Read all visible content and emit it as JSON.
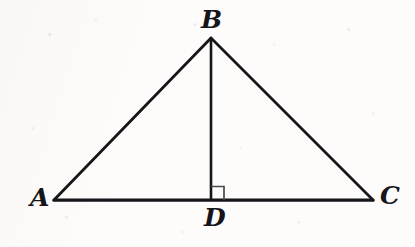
{
  "figure": {
    "kind": "geometry-diagram",
    "background_color": "#fdfcfa",
    "stroke_color": "#16161a",
    "right_angle_mark_color": "#4a4a4e",
    "labels": [
      {
        "id": "A",
        "text": "A",
        "x": 38,
        "y": 198,
        "role": "vertex-label"
      },
      {
        "id": "B",
        "text": "B",
        "x": 211,
        "y": 20,
        "role": "vertex-label"
      },
      {
        "id": "C",
        "text": "C",
        "x": 388,
        "y": 196,
        "role": "vertex-label"
      },
      {
        "id": "D",
        "text": "D",
        "x": 213,
        "y": 218,
        "role": "vertex-label"
      }
    ],
    "points": {
      "A": {
        "x": 54,
        "y": 200
      },
      "B": {
        "x": 211,
        "y": 38
      },
      "C": {
        "x": 373,
        "y": 200
      },
      "D": {
        "x": 211,
        "y": 200
      }
    },
    "segments": [
      {
        "id": "AB",
        "from": "A",
        "to": "B",
        "width": 2.8
      },
      {
        "id": "BC",
        "from": "B",
        "to": "C",
        "width": 2.8
      },
      {
        "id": "AC",
        "from": "A",
        "to": "C",
        "width": 3.2
      },
      {
        "id": "BD",
        "from": "B",
        "to": "D",
        "width": 2.6
      }
    ],
    "right_angle": {
      "at": "D",
      "size": 13,
      "direction": "up-right",
      "width": 1.6
    }
  }
}
